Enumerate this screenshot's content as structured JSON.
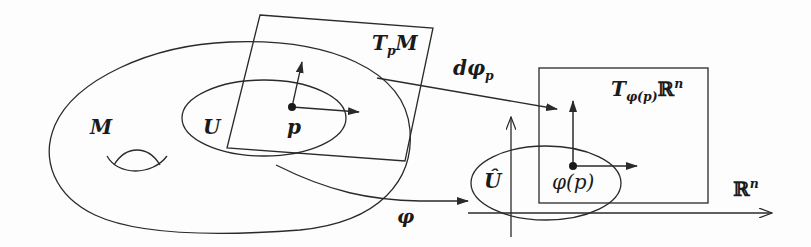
{
  "diagram": {
    "stroke_color": "#2a2a2a",
    "background": "#fdfdfd",
    "nodes": {
      "manifold": {
        "label": "M"
      },
      "open_set": {
        "label": "U"
      },
      "point": {
        "label": "p"
      },
      "tangent_space": {
        "label_main": "T",
        "label_sub": "p",
        "label_tail": "M"
      },
      "image_set": {
        "label": "Û"
      },
      "image_point": {
        "label": "φ(p)"
      },
      "image_tangent_space": {
        "label_main": "T",
        "label_sub": "φ(p)",
        "label_tail": "ℝ",
        "label_sup": "n"
      },
      "euclidean_space": {
        "label_main": "ℝ",
        "label_sup": "n"
      }
    },
    "edges": {
      "chart_map": {
        "label": "φ",
        "from": "U",
        "to": "Û"
      },
      "differential": {
        "label_main": "dφ",
        "label_sub": "p",
        "from": "TpM",
        "to": "Tφ(p)ℝn"
      }
    }
  }
}
